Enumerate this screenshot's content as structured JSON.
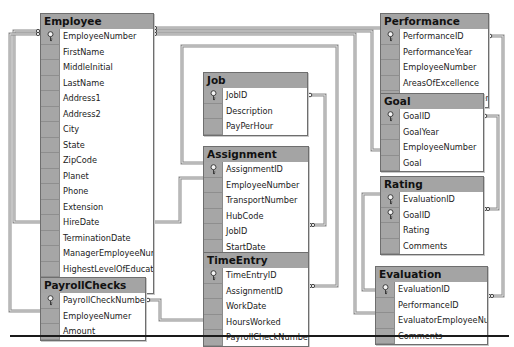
{
  "diagram": {
    "tables": [
      {
        "id": "employee",
        "title": "Employee",
        "x": 40,
        "y": 13,
        "w": 112,
        "columns": [
          {
            "name": "EmployeeNumber",
            "pk": true
          },
          {
            "name": "FirstName",
            "pk": false
          },
          {
            "name": "MiddleInitial",
            "pk": false
          },
          {
            "name": "LastName",
            "pk": false
          },
          {
            "name": "Address1",
            "pk": false
          },
          {
            "name": "Address2",
            "pk": false
          },
          {
            "name": "City",
            "pk": false
          },
          {
            "name": "State",
            "pk": false
          },
          {
            "name": "ZipCode",
            "pk": false
          },
          {
            "name": "Planet",
            "pk": false
          },
          {
            "name": "Phone",
            "pk": false
          },
          {
            "name": "Extension",
            "pk": false
          },
          {
            "name": "HireDate",
            "pk": false
          },
          {
            "name": "TerminationDate",
            "pk": false
          },
          {
            "name": "ManagerEmployeeNumber",
            "pk": false
          },
          {
            "name": "HighestLevelOfEducation",
            "pk": false
          },
          {
            "name": "UnionMembership",
            "pk": false
          }
        ]
      },
      {
        "id": "job",
        "title": "Job",
        "x": 203,
        "y": 72,
        "w": 103,
        "columns": [
          {
            "name": "JobID",
            "pk": true
          },
          {
            "name": "Description",
            "pk": false
          },
          {
            "name": "PayPerHour",
            "pk": false
          }
        ]
      },
      {
        "id": "assignment",
        "title": "Assignment",
        "x": 203,
        "y": 146,
        "w": 104,
        "columns": [
          {
            "name": "AssignmentID",
            "pk": true
          },
          {
            "name": "EmployeeNumber",
            "pk": false
          },
          {
            "name": "TransportNumber",
            "pk": false
          },
          {
            "name": "HubCode",
            "pk": false
          },
          {
            "name": "JobID",
            "pk": false
          },
          {
            "name": "StartDate",
            "pk": false
          },
          {
            "name": "EndDate",
            "pk": false
          }
        ]
      },
      {
        "id": "timeentry",
        "title": "TimeEntry",
        "x": 203,
        "y": 252,
        "w": 104,
        "columns": [
          {
            "name": "TimeEntryID",
            "pk": true
          },
          {
            "name": "AssignmentID",
            "pk": false
          },
          {
            "name": "WorkDate",
            "pk": false
          },
          {
            "name": "HoursWorked",
            "pk": false
          },
          {
            "name": "PayrollCheckNumber",
            "pk": false
          }
        ]
      },
      {
        "id": "payrollchecks",
        "title": "PayrollChecks",
        "x": 40,
        "y": 277,
        "w": 104,
        "columns": [
          {
            "name": "PayrollCheckNumber",
            "pk": true
          },
          {
            "name": "EmployeeNumer",
            "pk": false
          },
          {
            "name": "Amount",
            "pk": false
          }
        ]
      },
      {
        "id": "performance",
        "title": "Performance",
        "x": 380,
        "y": 13,
        "w": 107,
        "columns": [
          {
            "name": "PerformanceID",
            "pk": true
          },
          {
            "name": "PerformanceYear",
            "pk": false
          },
          {
            "name": "EmployeeNumber",
            "pk": false
          },
          {
            "name": "AreasOfExcellence",
            "pk": false
          },
          {
            "name": "AreasForImprovement",
            "pk": false
          }
        ]
      },
      {
        "id": "goal",
        "title": "Goal",
        "x": 380,
        "y": 93,
        "w": 102,
        "columns": [
          {
            "name": "GoalID",
            "pk": true
          },
          {
            "name": "GoalYear",
            "pk": false
          },
          {
            "name": "EmployeeNumber",
            "pk": false
          },
          {
            "name": "Goal",
            "pk": false
          }
        ]
      },
      {
        "id": "rating",
        "title": "Rating",
        "x": 380,
        "y": 176,
        "w": 102,
        "columns": [
          {
            "name": "EvaluationID",
            "pk": true
          },
          {
            "name": "GoalID",
            "pk": true
          },
          {
            "name": "Rating",
            "pk": false
          },
          {
            "name": "Comments",
            "pk": false
          }
        ]
      },
      {
        "id": "evaluation",
        "title": "Evaluation",
        "x": 375,
        "y": 266,
        "w": 111,
        "columns": [
          {
            "name": "EvaluationID",
            "pk": true
          },
          {
            "name": "PerformanceID",
            "pk": false
          },
          {
            "name": "EvaluatorEmployeeNumber",
            "pk": false
          },
          {
            "name": "Comments",
            "pk": false
          }
        ]
      }
    ],
    "relationships": [
      {
        "from": "Employee.EmployeeNumber",
        "to": "Performance.EmployeeNumber"
      },
      {
        "from": "Employee.EmployeeNumber",
        "to": "Goal.EmployeeNumber"
      },
      {
        "from": "Employee.EmployeeNumber",
        "to": "Evaluation.EvaluatorEmployeeNumber"
      },
      {
        "from": "Employee.EmployeeNumber",
        "to": "Assignment.EmployeeNumber"
      },
      {
        "from": "Employee.EmployeeNumber",
        "to": "PayrollChecks.EmployeeNumer"
      },
      {
        "from": "Job.JobID",
        "to": "Assignment.JobID"
      },
      {
        "from": "Assignment.AssignmentID",
        "to": "TimeEntry.AssignmentID"
      },
      {
        "from": "PayrollChecks.PayrollCheckNumber",
        "to": "TimeEntry.PayrollCheckNumber"
      },
      {
        "from": "Performance.PerformanceID",
        "to": "Evaluation.PerformanceID"
      },
      {
        "from": "Goal.GoalID",
        "to": "Rating.GoalID"
      },
      {
        "from": "Evaluation.EvaluationID",
        "to": "Rating.EvaluationID"
      }
    ]
  }
}
